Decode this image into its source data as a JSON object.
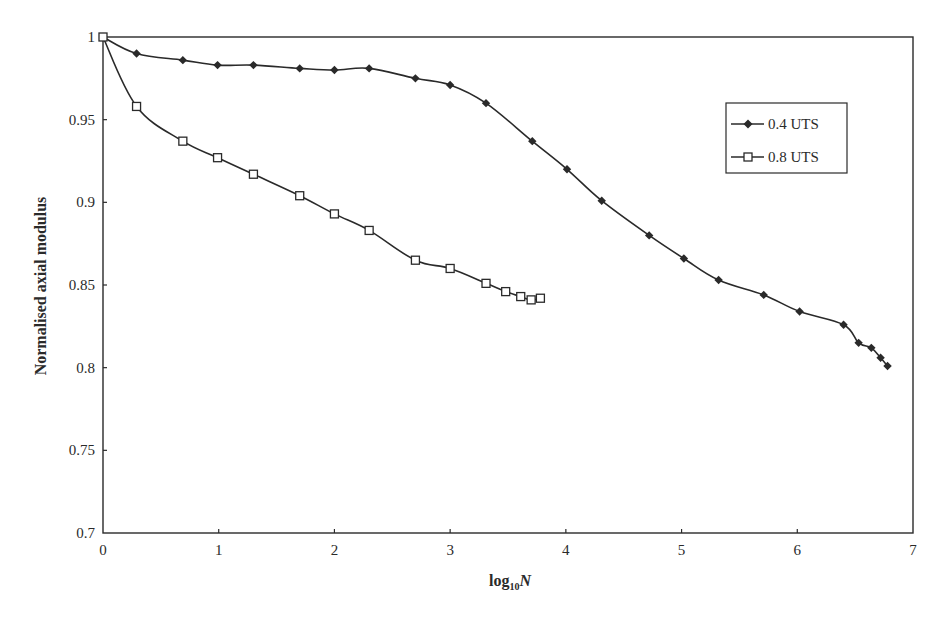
{
  "chart_data": {
    "type": "line",
    "title": "",
    "xlabel": "log10N",
    "xlabel_main": "log",
    "xlabel_sub": "10",
    "xlabel_var": "N",
    "ylabel": "Normalised axial modulus",
    "xlim": [
      0,
      7
    ],
    "ylim": [
      0.7,
      1
    ],
    "x_ticks": [
      "0",
      "1",
      "2",
      "3",
      "4",
      "5",
      "6",
      "7"
    ],
    "y_ticks": [
      "0.7",
      "0.75",
      "0.8",
      "0.85",
      "0.9",
      "0.95",
      "1"
    ],
    "grid": false,
    "legend_position": "upper right (inside)",
    "series": [
      {
        "name": "0.4 UTS",
        "marker": "filled-diamond",
        "x": [
          0,
          0.29,
          0.69,
          0.99,
          1.3,
          1.7,
          2.0,
          2.3,
          2.7,
          3.0,
          3.31,
          3.71,
          4.01,
          4.31,
          4.72,
          5.02,
          5.32,
          5.71,
          6.02,
          6.4,
          6.53,
          6.64,
          6.72,
          6.78
        ],
        "values": [
          1.0,
          0.99,
          0.986,
          0.983,
          0.983,
          0.981,
          0.98,
          0.981,
          0.975,
          0.971,
          0.96,
          0.937,
          0.92,
          0.901,
          0.88,
          0.866,
          0.853,
          0.844,
          0.834,
          0.826,
          0.815,
          0.812,
          0.806,
          0.801
        ]
      },
      {
        "name": "0.8 UTS",
        "marker": "open-square",
        "x": [
          0,
          0.29,
          0.69,
          0.99,
          1.3,
          1.7,
          2.0,
          2.3,
          2.7,
          3.0,
          3.31,
          3.48,
          3.61,
          3.7,
          3.78
        ],
        "values": [
          1.0,
          0.958,
          0.937,
          0.927,
          0.917,
          0.904,
          0.893,
          0.883,
          0.865,
          0.86,
          0.851,
          0.846,
          0.843,
          0.841,
          0.842
        ]
      }
    ]
  }
}
